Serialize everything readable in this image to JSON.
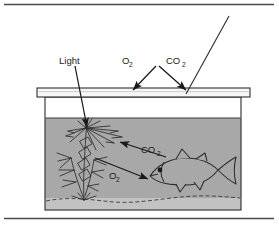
{
  "figure": {
    "rules": {
      "top_rule": "horizontal-rule",
      "bottom_rule": "horizontal-rule"
    },
    "colors": {
      "water": "#a8a8a8",
      "substrate": "#c4c4c4",
      "lid": "#f4f4f4",
      "ink": "#1a1a1a",
      "page": "#ffffff"
    },
    "labels": {
      "light": "Light",
      "oxygen_top": "O",
      "oxygen_top_sub": "2",
      "carbon_dioxide_top": "CO",
      "carbon_dioxide_top_sub": "2",
      "carbon_dioxide_water": "CO",
      "carbon_dioxide_water_sub": "2",
      "oxygen_water": "O",
      "oxygen_water_sub": "2"
    },
    "elements": {
      "tank": "aquarium-tank",
      "lid": "tank-lid",
      "water": "water-body",
      "substrate": "gravel-substrate",
      "plant": "aquatic-plant",
      "fish": "fish",
      "light_ray": "light-ray-line",
      "light_arrow": "light-arrow",
      "o2_top_arrow": "oxygen-release-arrow",
      "co2_top_arrow": "carbon-dioxide-entry-arrow",
      "co2_water_arrow": "fish-to-plant-co2-arrow",
      "o2_water_arrow": "plant-to-fish-o2-arrow"
    }
  }
}
